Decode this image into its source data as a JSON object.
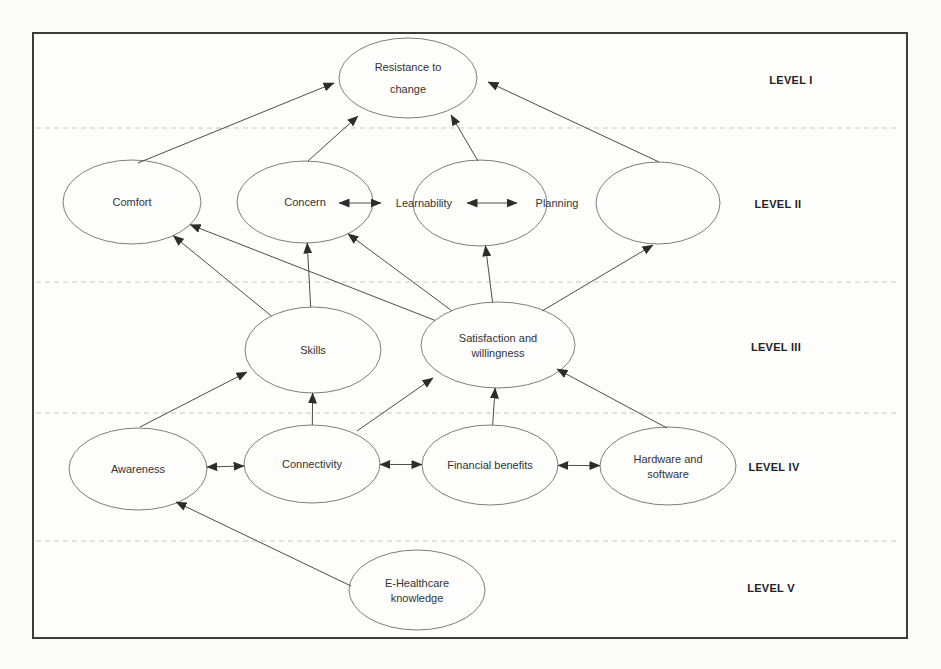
{
  "figure": {
    "levels": [
      {
        "label": "LEVEL I"
      },
      {
        "label": "LEVEL II"
      },
      {
        "label": "LEVEL III"
      },
      {
        "label": "LEVEL IV"
      },
      {
        "label": "LEVEL V"
      }
    ],
    "nodes": [
      {
        "id": "resistance",
        "lines": [
          "Resistance to",
          "change"
        ]
      },
      {
        "id": "comfort",
        "lines": [
          "Comfort"
        ]
      },
      {
        "id": "concern",
        "lines": [
          "Concern"
        ]
      },
      {
        "id": "learnability",
        "lines": [
          "Learnability"
        ]
      },
      {
        "id": "planning",
        "lines": [
          "Planning"
        ]
      },
      {
        "id": "unlabeled",
        "lines": []
      },
      {
        "id": "skills",
        "lines": [
          "Skills"
        ]
      },
      {
        "id": "satisfaction",
        "lines": [
          "Satisfaction and",
          "willingness"
        ]
      },
      {
        "id": "awareness",
        "lines": [
          "Awareness"
        ]
      },
      {
        "id": "connectivity",
        "lines": [
          "Connectivity"
        ]
      },
      {
        "id": "financial",
        "lines": [
          "Financial benefits"
        ]
      },
      {
        "id": "hardware",
        "lines": [
          "Hardware and",
          "software"
        ]
      },
      {
        "id": "ehealth",
        "lines": [
          "E-Healthcare",
          "knowledge"
        ]
      }
    ],
    "edges": [
      {
        "from": "comfort",
        "to": "resistance",
        "type": "arrow"
      },
      {
        "from": "concern",
        "to": "resistance",
        "type": "arrow"
      },
      {
        "from": "learnability",
        "to": "resistance",
        "type": "arrow"
      },
      {
        "from": "unlabeled",
        "to": "resistance",
        "type": "arrow"
      },
      {
        "from": "concern",
        "to": "learnability",
        "type": "double"
      },
      {
        "from": "learnability",
        "to": "planning",
        "type": "double"
      },
      {
        "from": "skills",
        "to": "comfort",
        "type": "arrow"
      },
      {
        "from": "satisfaction",
        "to": "comfort",
        "type": "arrow"
      },
      {
        "from": "skills",
        "to": "concern",
        "type": "arrow"
      },
      {
        "from": "satisfaction",
        "to": "concern",
        "type": "arrow"
      },
      {
        "from": "satisfaction",
        "to": "learnability",
        "type": "arrow"
      },
      {
        "from": "satisfaction",
        "to": "unlabeled",
        "type": "arrow"
      },
      {
        "from": "awareness",
        "to": "skills",
        "type": "arrow"
      },
      {
        "from": "connectivity",
        "to": "skills",
        "type": "arrow"
      },
      {
        "from": "connectivity",
        "to": "satisfaction",
        "type": "arrow"
      },
      {
        "from": "financial",
        "to": "satisfaction",
        "type": "arrow"
      },
      {
        "from": "hardware",
        "to": "satisfaction",
        "type": "arrow"
      },
      {
        "from": "awareness",
        "to": "connectivity",
        "type": "double"
      },
      {
        "from": "connectivity",
        "to": "financial",
        "type": "double"
      },
      {
        "from": "financial",
        "to": "hardware",
        "type": "double"
      },
      {
        "from": "ehealth",
        "to": "awareness",
        "type": "arrow"
      }
    ]
  }
}
